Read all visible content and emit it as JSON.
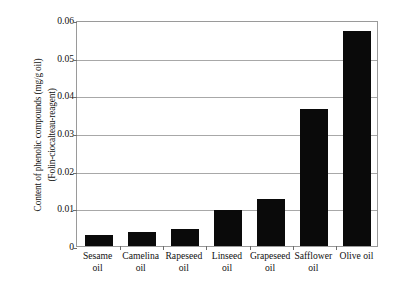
{
  "chart_data": {
    "type": "bar",
    "title": "",
    "xlabel": "",
    "ylabel": "Content of phenolic compounds (mg/g oil) (Folin-ciocalteau-reagent)",
    "ylabel_lines": [
      "Content of phenolic compounds (mg/g oil)",
      "(Folin-ciocalteau-reagent)"
    ],
    "categories": [
      "Sesame oil",
      "Camelina oil",
      "Rapeseed oil",
      "Linseed oil",
      "Grapeseed oil",
      "Safflower oil",
      "Olive oil"
    ],
    "category_lines": [
      [
        "Sesame",
        "oil"
      ],
      [
        "Camelina",
        "oil"
      ],
      [
        "Rapeseed",
        "oil"
      ],
      [
        "Linseed",
        "oil"
      ],
      [
        "Grapeseed",
        "oil"
      ],
      [
        "Safflower",
        "oil"
      ],
      [
        "Olive oil",
        ""
      ]
    ],
    "values": [
      0.003,
      0.0038,
      0.0045,
      0.0095,
      0.0125,
      0.0363,
      0.057
    ],
    "ylim": [
      0,
      0.06
    ],
    "yticks": [
      0,
      0.01,
      0.02,
      0.03,
      0.04,
      0.05,
      0.06
    ],
    "ytick_labels": [
      "0",
      "0.01",
      "0.02",
      "0.03",
      "0.04",
      "0.05",
      "0.06"
    ],
    "grid": true,
    "legend": false,
    "bar_color": "#0a0a0a",
    "grid_color": "#a8a8a8",
    "frame_color": "#9a9a9a",
    "background": "#ffffff"
  }
}
